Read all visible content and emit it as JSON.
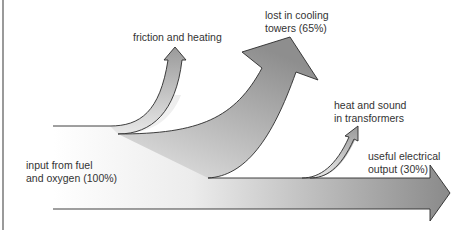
{
  "diagram": {
    "type": "sankey-energy-flow",
    "colors": {
      "stroke": "#2a2a2a",
      "fill_light": "#f4f4f4",
      "fill_dark": "#8c8c8c",
      "text": "#333333",
      "frame": "#9a9a9a"
    },
    "labels": {
      "input": [
        "input from fuel",
        "and oxygen (100%)"
      ],
      "friction": "friction and heating",
      "cooling": [
        "lost in cooling",
        "towers (65%)"
      ],
      "transformers": [
        "heat and sound",
        "in transformers"
      ],
      "output": [
        "useful electrical",
        "output (30%)"
      ]
    },
    "flows": [
      {
        "name": "input from fuel and oxygen",
        "percent": 100
      },
      {
        "name": "friction and heating",
        "percent": null
      },
      {
        "name": "lost in cooling towers",
        "percent": 65
      },
      {
        "name": "heat and sound in transformers",
        "percent": null
      },
      {
        "name": "useful electrical output",
        "percent": 30
      }
    ]
  }
}
